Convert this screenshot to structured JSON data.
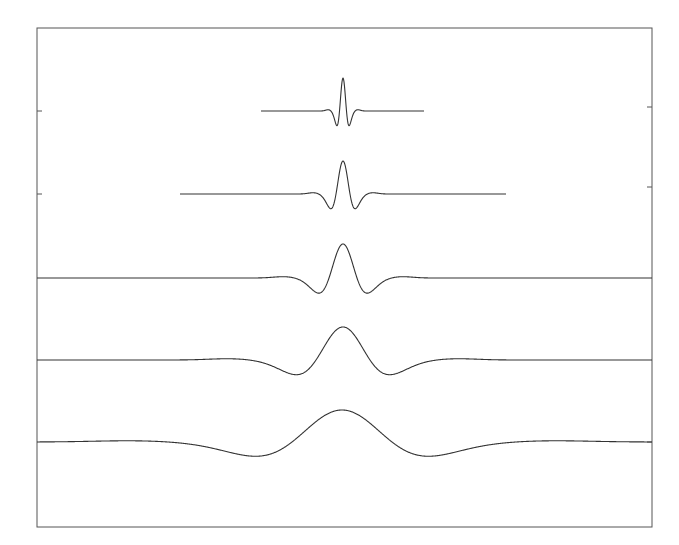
{
  "chart_data": {
    "type": "line",
    "title": "",
    "xlabel": "",
    "ylabel": "",
    "grid": false,
    "legend": null,
    "frame": {
      "left": 37,
      "top": 28,
      "right": 652,
      "bottom": 527
    },
    "left_ticks_y": [
      111,
      194
    ],
    "right_ticks_y": [
      107,
      187,
      442
    ],
    "series": [
      {
        "name": "scale-1",
        "baseline_y": 111,
        "x_start": 261,
        "x_end": 424,
        "center_x": 343,
        "peak_y": 78,
        "trough_y": 131,
        "trough_x": [
          338,
          349
        ],
        "amplitude": 33,
        "sigma_px": 3.5
      },
      {
        "name": "scale-2",
        "baseline_y": 194,
        "x_start": 180,
        "x_end": 506,
        "center_x": 343,
        "peak_y": 161,
        "trough_y": 214,
        "trough_x": [
          332,
          354
        ],
        "amplitude": 33,
        "sigma_px": 7
      },
      {
        "name": "scale-3",
        "baseline_y": 278,
        "x_start": 37,
        "x_end": 652,
        "center_x": 343,
        "peak_y": 244,
        "trough_y": 297,
        "trough_x": [
          320,
          366
        ],
        "amplitude": 34,
        "sigma_px": 14
      },
      {
        "name": "scale-4",
        "baseline_y": 360,
        "x_start": 37,
        "x_end": 652,
        "center_x": 343,
        "peak_y": 327,
        "trough_y": 380,
        "trough_x": [
          298,
          387
        ],
        "amplitude": 33,
        "sigma_px": 27
      },
      {
        "name": "scale-5",
        "baseline_y": 442,
        "x_start": 37,
        "x_end": 652,
        "center_x": 342,
        "peak_y": 410,
        "trough_y": 463,
        "trough_x": [
          258,
          428
        ],
        "amplitude": 32,
        "sigma_px": 50
      }
    ]
  }
}
